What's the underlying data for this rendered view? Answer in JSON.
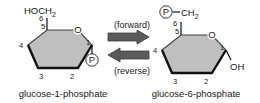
{
  "figure": {
    "type": "chemical-reaction-diagram",
    "background_color": "#ffffff",
    "ring_fill_color": "#bfbfbf",
    "ring_stroke_color": "#404040",
    "bold_bond_color": "#111111",
    "arrow_color": "#5a5a5a",
    "text_color": "#1a1a1a"
  },
  "left": {
    "caption": "glucose-1-phosphate",
    "top_group": "HOCH",
    "top_group_sub": "2",
    "ring_oxygen": "O",
    "phosphate": "P",
    "carbon_numbers": [
      "6",
      "5",
      "4",
      "3",
      "2",
      "1"
    ]
  },
  "right": {
    "caption": "glucose-6-phosphate",
    "phosphate": "P",
    "top_group": "CH",
    "top_group_sub": "2",
    "bond_dash": "—",
    "ring_oxygen": "O",
    "hydroxyl": "OH",
    "carbon_numbers": [
      "6",
      "5",
      "4",
      "3",
      "2",
      "1"
    ]
  },
  "arrows": {
    "forward_label": "(forward)",
    "reverse_label": "(reverse)"
  }
}
